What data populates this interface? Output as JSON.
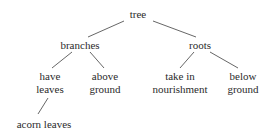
{
  "diagram": {
    "type": "tree",
    "colors": {
      "background": "#ffffff",
      "text": "#2b2b2b",
      "edge": "#555555"
    },
    "nodes": [
      {
        "id": "tree",
        "label": "tree",
        "line1": "tree",
        "line2": "",
        "x": 138,
        "y": 8,
        "level": 0
      },
      {
        "id": "branches",
        "label": "branches",
        "line1": "branches",
        "line2": "",
        "x": 80,
        "y": 39,
        "level": 1
      },
      {
        "id": "roots",
        "label": "roots",
        "line1": "roots",
        "line2": "",
        "x": 200,
        "y": 39,
        "level": 1
      },
      {
        "id": "have-leaves",
        "label": "have leaves",
        "line1": "have",
        "line2": "leaves",
        "x": 50,
        "y": 70,
        "level": 2
      },
      {
        "id": "above-ground",
        "label": "above ground",
        "line1": "above",
        "line2": "ground",
        "x": 105,
        "y": 70,
        "level": 2
      },
      {
        "id": "take-in-nourishment",
        "label": "take in nourishment",
        "line1": "take in",
        "line2": "nourishment",
        "x": 180,
        "y": 70,
        "level": 2
      },
      {
        "id": "below-ground",
        "label": "below ground",
        "line1": "below",
        "line2": "ground",
        "x": 243,
        "y": 70,
        "level": 2
      },
      {
        "id": "acorn-leaves",
        "label": "acorn leaves",
        "line1": "acorn leaves",
        "line2": "",
        "x": 44,
        "y": 118,
        "level": 3
      }
    ],
    "edges": [
      {
        "id": "tree-branches",
        "from": "tree",
        "to": "branches",
        "x1": 124,
        "y1": 21,
        "x2": 88,
        "y2": 37
      },
      {
        "id": "tree-roots",
        "from": "tree",
        "to": "roots",
        "x1": 153,
        "y1": 21,
        "x2": 196,
        "y2": 37
      },
      {
        "id": "branches-have-leaves",
        "from": "branches",
        "to": "have-leaves",
        "x1": 72,
        "y1": 52,
        "x2": 52,
        "y2": 68
      },
      {
        "id": "branches-above-ground",
        "from": "branches",
        "to": "above-ground",
        "x1": 90,
        "y1": 52,
        "x2": 104,
        "y2": 68
      },
      {
        "id": "roots-take-in-nourishment",
        "from": "roots",
        "to": "take-in-nourishment",
        "x1": 194,
        "y1": 52,
        "x2": 180,
        "y2": 68
      },
      {
        "id": "roots-below-ground",
        "from": "roots",
        "to": "below-ground",
        "x1": 210,
        "y1": 52,
        "x2": 238,
        "y2": 68
      },
      {
        "id": "have-leaves-acorn-leaves",
        "from": "have-leaves",
        "to": "acorn-leaves",
        "x1": 48,
        "y1": 98,
        "x2": 38,
        "y2": 114
      }
    ]
  }
}
